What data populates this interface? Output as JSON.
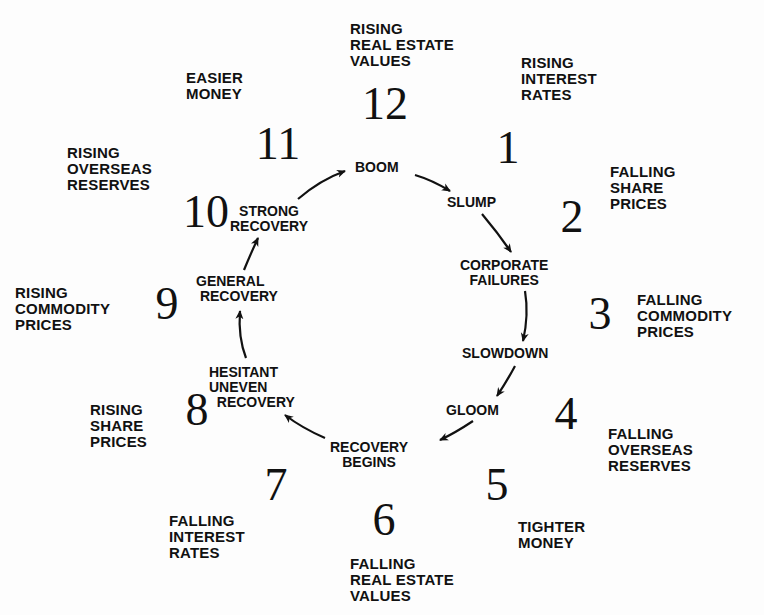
{
  "diagram": {
    "type": "economic-cycle-clock",
    "clock_numbers": [
      "12",
      "1",
      "2",
      "3",
      "4",
      "5",
      "6",
      "7",
      "8",
      "9",
      "10",
      "11"
    ],
    "outer_labels": [
      {
        "hour": "12",
        "text": "RISING\nREAL ESTATE\nVALUES"
      },
      {
        "hour": "1",
        "text": "RISING\nINTEREST\nRATES"
      },
      {
        "hour": "2",
        "text": "FALLING\nSHARE\nPRICES"
      },
      {
        "hour": "3",
        "text": "FALLING\nCOMMODITY\nPRICES"
      },
      {
        "hour": "4",
        "text": "FALLING\nOVERSEAS\nRESERVES"
      },
      {
        "hour": "5",
        "text": "TIGHTER\nMONEY"
      },
      {
        "hour": "6",
        "text": "FALLING\nREAL ESTATE\nVALUES"
      },
      {
        "hour": "7",
        "text": "FALLING\nINTEREST\nRATES"
      },
      {
        "hour": "8",
        "text": "RISING\nSHARE\nPRICES"
      },
      {
        "hour": "9",
        "text": "RISING\nCOMMODITY\nPRICES"
      },
      {
        "hour": "10",
        "text": "RISING\nOVERSEAS\nRESERVES"
      },
      {
        "hour": "11",
        "text": "EASIER\nMONEY"
      }
    ],
    "cycle_stages": [
      "BOOM",
      "SLUMP",
      "CORPORATE\nFAILURES",
      "SLOWDOWN",
      "GLOOM",
      "RECOVERY\nBEGINS",
      "HESITANT\nUNEVEN\n  RECOVERY",
      "GENERAL\n RECOVERY",
      "STRONG\nRECOVERY"
    ],
    "colors": {
      "ink": "#111111",
      "background": "#fdfdfd"
    }
  }
}
